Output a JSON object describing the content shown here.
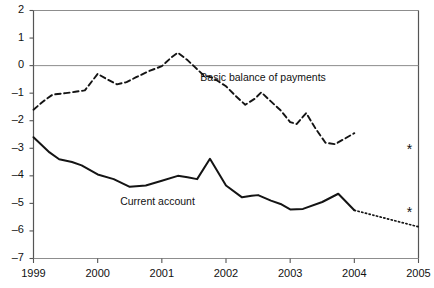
{
  "chart_data": {
    "type": "line",
    "title": "",
    "xlabel": "",
    "ylabel": "",
    "xlim": [
      1999,
      2005
    ],
    "ylim": [
      -7,
      2
    ],
    "grid": false,
    "zero_line": true,
    "legend": "inline-annotations",
    "yticks": [
      "2",
      "1",
      "0",
      "–1",
      "–2",
      "–3",
      "–4",
      "–5",
      "–6",
      "–7"
    ],
    "ytick_values": [
      2,
      1,
      0,
      -1,
      -2,
      -3,
      -4,
      -5,
      -6,
      -7
    ],
    "xticks": [
      "1999",
      "2000",
      "2001",
      "2002",
      "2003",
      "2004",
      "2005"
    ],
    "xtick_values": [
      1999,
      2000,
      2001,
      2002,
      2003,
      2004,
      2005
    ],
    "series": [
      {
        "name": "Basic balance of payments",
        "style": "dashed",
        "label_x": 2001.6,
        "label_y": -0.45,
        "x": [
          1999.0,
          1999.15,
          1999.3,
          1999.5,
          1999.65,
          1999.8,
          2000.0,
          2000.15,
          2000.3,
          2000.45,
          2000.6,
          2000.8,
          2001.0,
          2001.15,
          2001.25,
          2001.4,
          2001.5,
          2001.65,
          2001.8,
          2002.0,
          2002.15,
          2002.3,
          2002.45,
          2002.55,
          2002.7,
          2002.85,
          2003.0,
          2003.1,
          2003.25,
          2003.4,
          2003.55,
          2003.7,
          2003.85,
          2004.0
        ],
        "y": [
          -1.6,
          -1.3,
          -1.05,
          -1.0,
          -0.95,
          -0.9,
          -0.3,
          -0.5,
          -0.68,
          -0.6,
          -0.42,
          -0.2,
          -0.02,
          0.3,
          0.47,
          0.2,
          -0.02,
          -0.35,
          -0.45,
          -0.75,
          -1.1,
          -1.42,
          -1.2,
          -0.97,
          -1.3,
          -1.62,
          -2.05,
          -2.12,
          -1.72,
          -2.3,
          -2.8,
          -2.85,
          -2.65,
          -2.45
        ]
      },
      {
        "name": "Current account",
        "style": "solid",
        "label_x": 2000.35,
        "label_y": -4.95,
        "x": [
          1999.0,
          1999.25,
          1999.4,
          1999.6,
          1999.75,
          2000.0,
          2000.25,
          2000.5,
          2000.6,
          2000.75,
          2001.0,
          2001.25,
          2001.4,
          2001.55,
          2001.75,
          2002.0,
          2002.25,
          2002.4,
          2002.5,
          2002.7,
          2002.85,
          2003.0,
          2003.2,
          2003.5,
          2003.75,
          2004.0
        ],
        "y": [
          -2.6,
          -3.15,
          -3.4,
          -3.5,
          -3.62,
          -3.95,
          -4.12,
          -4.4,
          -4.38,
          -4.35,
          -4.18,
          -4.0,
          -4.05,
          -4.12,
          -3.38,
          -4.35,
          -4.78,
          -4.72,
          -4.7,
          -4.9,
          -5.02,
          -5.22,
          -5.2,
          -4.95,
          -4.65,
          -5.25
        ]
      },
      {
        "name": "Current account projection",
        "style": "dotted",
        "x": [
          2004.0,
          2005.0
        ],
        "y": [
          -5.25,
          -5.85
        ]
      }
    ],
    "markers": [
      {
        "name": "forecast-marker-upper",
        "symbol": "*",
        "x": 2004.86,
        "y": -3.05
      },
      {
        "name": "forecast-marker-lower",
        "symbol": "*",
        "x": 2004.86,
        "y": -5.32
      }
    ]
  }
}
